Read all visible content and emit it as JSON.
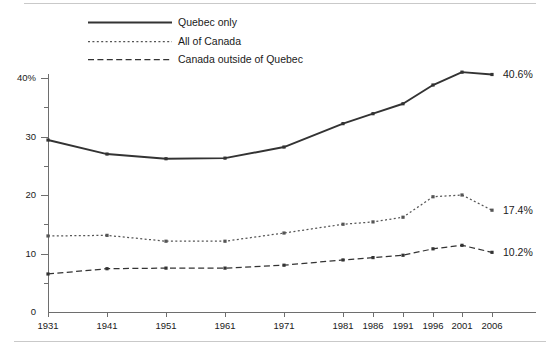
{
  "chart_data": {
    "type": "line",
    "title": "",
    "subtitle": "",
    "xlabel": "",
    "ylabel": "",
    "x": [
      "1931",
      "1941",
      "1951",
      "1961",
      "1971",
      "1981",
      "1986",
      "1991",
      "1996",
      "2001",
      "2006"
    ],
    "xtick_labels": [
      "1931",
      "1941",
      "1951",
      "1961",
      "1971",
      "1981",
      "1986",
      "1991",
      "1996",
      "2001",
      "2006"
    ],
    "ytick_labels": [
      "0",
      "10",
      "20",
      "30",
      "40%"
    ],
    "ytick_values": [
      0,
      10,
      20,
      30,
      40
    ],
    "yminor_values": [
      5,
      15,
      25,
      35
    ],
    "ylim": [
      0,
      43
    ],
    "grid": false,
    "legend_position": "top-left",
    "series": [
      {
        "name": "Quebec only",
        "style": "solid",
        "color": "#333333",
        "values": [
          29.4,
          27.0,
          26.2,
          26.3,
          28.2,
          32.2,
          33.9,
          35.6,
          38.8,
          41.0,
          40.6
        ],
        "end_label": "40.6%"
      },
      {
        "name": "All of Canada",
        "style": "dotted",
        "color": "#555555",
        "values": [
          13.0,
          13.1,
          12.1,
          12.1,
          13.5,
          15.0,
          15.4,
          16.2,
          19.7,
          20.0,
          17.4
        ],
        "end_label": "17.4%"
      },
      {
        "name": "Canada outside of Quebec",
        "style": "dashed",
        "color": "#333333",
        "values": [
          6.5,
          7.4,
          7.5,
          7.5,
          8.0,
          8.9,
          9.3,
          9.7,
          10.8,
          11.4,
          10.2
        ],
        "end_label": "10.2%"
      }
    ]
  },
  "legend": {
    "items": [
      {
        "label": "Quebec only"
      },
      {
        "label": "All of Canada"
      },
      {
        "label": "Canada outside of Quebec"
      }
    ]
  },
  "end_labels": [
    {
      "text": "40.6%"
    },
    {
      "text": "17.4%"
    },
    {
      "text": "10.2%"
    }
  ]
}
